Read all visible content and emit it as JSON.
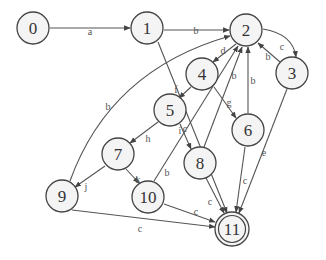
{
  "diagram": {
    "type": "state-machine",
    "colors": {
      "stroke": "#555555",
      "node_fill": "#f4f4f4",
      "text": "#333333"
    },
    "nodes": [
      {
        "id": "0",
        "label": "0",
        "x": 33,
        "y": 28,
        "accepting": false
      },
      {
        "id": "1",
        "label": "1",
        "x": 147,
        "y": 28,
        "accepting": false
      },
      {
        "id": "2",
        "label": "2",
        "x": 246,
        "y": 30,
        "accepting": false
      },
      {
        "id": "3",
        "label": "3",
        "x": 292,
        "y": 73,
        "accepting": false
      },
      {
        "id": "4",
        "label": "4",
        "x": 202,
        "y": 74,
        "accepting": false
      },
      {
        "id": "5",
        "label": "5",
        "x": 170,
        "y": 110,
        "accepting": false
      },
      {
        "id": "6",
        "label": "6",
        "x": 248,
        "y": 130,
        "accepting": false
      },
      {
        "id": "7",
        "label": "7",
        "x": 118,
        "y": 154,
        "accepting": false
      },
      {
        "id": "8",
        "label": "8",
        "x": 200,
        "y": 163,
        "accepting": false
      },
      {
        "id": "9",
        "label": "9",
        "x": 62,
        "y": 196,
        "accepting": false
      },
      {
        "id": "10",
        "label": "10",
        "x": 148,
        "y": 197,
        "accepting": false
      },
      {
        "id": "11",
        "label": "11",
        "x": 232,
        "y": 229,
        "accepting": true
      }
    ],
    "edges": [
      {
        "from": "0",
        "to": "1",
        "label": "a"
      },
      {
        "from": "1",
        "to": "2",
        "label": "b"
      },
      {
        "from": "1",
        "to": "11",
        "label": "c"
      },
      {
        "from": "2",
        "to": "3",
        "label": "c"
      },
      {
        "from": "3",
        "to": "2",
        "label": "b"
      },
      {
        "from": "2",
        "to": "4",
        "label": "d"
      },
      {
        "from": "4",
        "to": "5",
        "label": "f"
      },
      {
        "from": "4",
        "to": "6",
        "label": "g"
      },
      {
        "from": "6",
        "to": "2",
        "label": "b"
      },
      {
        "from": "5",
        "to": "7",
        "label": "h"
      },
      {
        "from": "5",
        "to": "8",
        "label": "i"
      },
      {
        "from": "7",
        "to": "9",
        "label": "j"
      },
      {
        "from": "7",
        "to": "10",
        "label": "k"
      },
      {
        "from": "8",
        "to": "2",
        "label": "b"
      },
      {
        "from": "10",
        "to": "2",
        "label": "b"
      },
      {
        "from": "9",
        "to": "2",
        "label": "b"
      },
      {
        "from": "9",
        "to": "11",
        "label": "c"
      },
      {
        "from": "10",
        "to": "11",
        "label": "c"
      },
      {
        "from": "8",
        "to": "11",
        "label": "c"
      },
      {
        "from": "6",
        "to": "11",
        "label": "c"
      },
      {
        "from": "3",
        "to": "11",
        "label": "e"
      }
    ]
  }
}
